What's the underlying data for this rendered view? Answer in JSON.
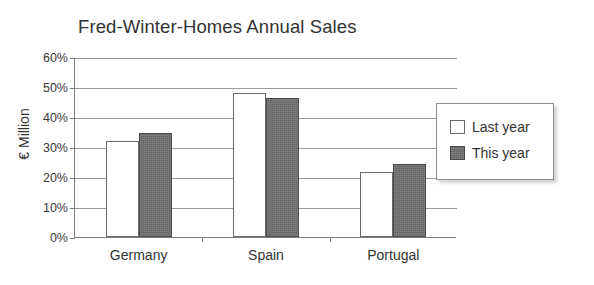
{
  "chart_data": {
    "type": "bar",
    "title": "Fred-Winter-Homes Annual Sales",
    "xlabel": "",
    "ylabel": "€ Million",
    "categories": [
      "Germany",
      "Spain",
      "Portugal"
    ],
    "series": [
      {
        "name": "Last year",
        "values": [
          32.0,
          48.0,
          21.8
        ],
        "color": "#ffffff"
      },
      {
        "name": "This year",
        "values": [
          34.7,
          46.5,
          24.2
        ],
        "color": "#707070"
      }
    ],
    "ylim": [
      0,
      60
    ],
    "yticks": [
      0,
      10,
      20,
      30,
      40,
      50,
      60
    ],
    "ytick_labels": [
      "0%",
      "10%",
      "20%",
      "30%",
      "40%",
      "50%",
      "60%"
    ],
    "grid": true,
    "legend_position": "right-inside-overlap"
  },
  "legend": {
    "entries": [
      {
        "label": "Last year"
      },
      {
        "label": "This year"
      }
    ]
  }
}
